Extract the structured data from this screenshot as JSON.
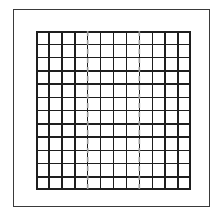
{
  "figure": {
    "title": "",
    "background_color": "#ffffff",
    "frame": {
      "name": "outer-frame",
      "stroke_color": "#3a3a3a",
      "stroke_width": 1,
      "x": 13,
      "y": 9,
      "width": 197,
      "height": 198
    },
    "grid": {
      "name": "cell-grid",
      "columns": 12,
      "rows": 12,
      "x": 36,
      "y": 31,
      "width": 155,
      "height": 159,
      "cell_width": 12.9,
      "cell_height": 13.25,
      "line_color": "#1e1e1e",
      "line_width": 1.5,
      "border_width": 2,
      "fill_color": "#ffffff"
    },
    "dashed_guides": {
      "name": "dashed-vertical-guides",
      "count": 2,
      "orientation": "vertical",
      "color": "#9a9a9a",
      "line_width": 1.6,
      "dash_pattern": "5 4",
      "at_columns": [
        4,
        8
      ],
      "x_positions": [
        51.67,
        103.33
      ]
    }
  },
  "chart_data": {
    "type": "heatmap",
    "title": "",
    "subtitle": "",
    "xlabel": "",
    "ylabel": "",
    "grid": true,
    "legend": "none",
    "categories": [
      "1",
      "2",
      "3",
      "4",
      "5",
      "6",
      "7",
      "8",
      "9",
      "10",
      "11",
      "12"
    ],
    "row_labels": [
      "1",
      "2",
      "3",
      "4",
      "5",
      "6",
      "7",
      "8",
      "9",
      "10",
      "11",
      "12"
    ],
    "xlim": [
      0,
      12
    ],
    "ylim": [
      0,
      12
    ],
    "values": [
      [
        0,
        0,
        0,
        0,
        0,
        0,
        0,
        0,
        0,
        0,
        0,
        0
      ],
      [
        0,
        0,
        0,
        0,
        0,
        0,
        0,
        0,
        0,
        0,
        0,
        0
      ],
      [
        0,
        0,
        0,
        0,
        0,
        0,
        0,
        0,
        0,
        0,
        0,
        0
      ],
      [
        0,
        0,
        0,
        0,
        0,
        0,
        0,
        0,
        0,
        0,
        0,
        0
      ],
      [
        0,
        0,
        0,
        0,
        0,
        0,
        0,
        0,
        0,
        0,
        0,
        0
      ],
      [
        0,
        0,
        0,
        0,
        0,
        0,
        0,
        0,
        0,
        0,
        0,
        0
      ],
      [
        0,
        0,
        0,
        0,
        0,
        0,
        0,
        0,
        0,
        0,
        0,
        0
      ],
      [
        0,
        0,
        0,
        0,
        0,
        0,
        0,
        0,
        0,
        0,
        0,
        0
      ],
      [
        0,
        0,
        0,
        0,
        0,
        0,
        0,
        0,
        0,
        0,
        0,
        0
      ],
      [
        0,
        0,
        0,
        0,
        0,
        0,
        0,
        0,
        0,
        0,
        0,
        0
      ],
      [
        0,
        0,
        0,
        0,
        0,
        0,
        0,
        0,
        0,
        0,
        0,
        0
      ],
      [
        0,
        0,
        0,
        0,
        0,
        0,
        0,
        0,
        0,
        0,
        0,
        0
      ]
    ],
    "annotations": [
      {
        "type": "vline",
        "at_column": 4,
        "style": "dashed",
        "color": "#9a9a9a"
      },
      {
        "type": "vline",
        "at_column": 8,
        "style": "dashed",
        "color": "#9a9a9a"
      }
    ]
  }
}
